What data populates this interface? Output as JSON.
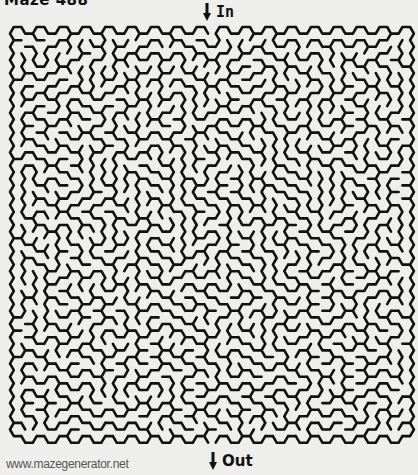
{
  "puzzle": {
    "title": "Maze 488",
    "entry_label": "In",
    "exit_label": "Out",
    "footer": "www.mazegenerator.net",
    "style": {
      "background": "#eeeeec",
      "wall_color": "#111111",
      "wall_width": 2.6
    },
    "grid": {
      "type": "hexagonal-flat-top",
      "columns": 35,
      "rows": 31,
      "cell_radius": 7.62,
      "origin_x": 10,
      "origin_y": 27,
      "entry_column": 17,
      "exit_column": 17,
      "seed": 488
    }
  }
}
